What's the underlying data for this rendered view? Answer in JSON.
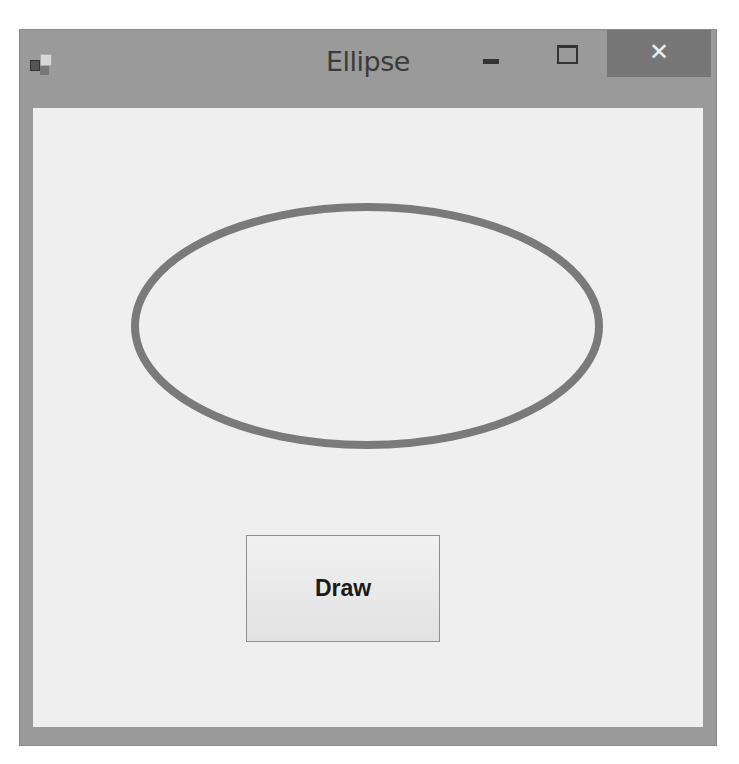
{
  "window": {
    "title": "Ellipse",
    "controls": {
      "minimize": "–",
      "maximize": "☐",
      "close": "✕"
    }
  },
  "canvas": {
    "shape": "ellipse",
    "stroke_color": "#7a7a7a",
    "fill": "none"
  },
  "buttons": {
    "draw_label": "Draw"
  },
  "colors": {
    "frame": "#9a9a9a",
    "client": "#efefef",
    "close_bg": "#777777"
  }
}
